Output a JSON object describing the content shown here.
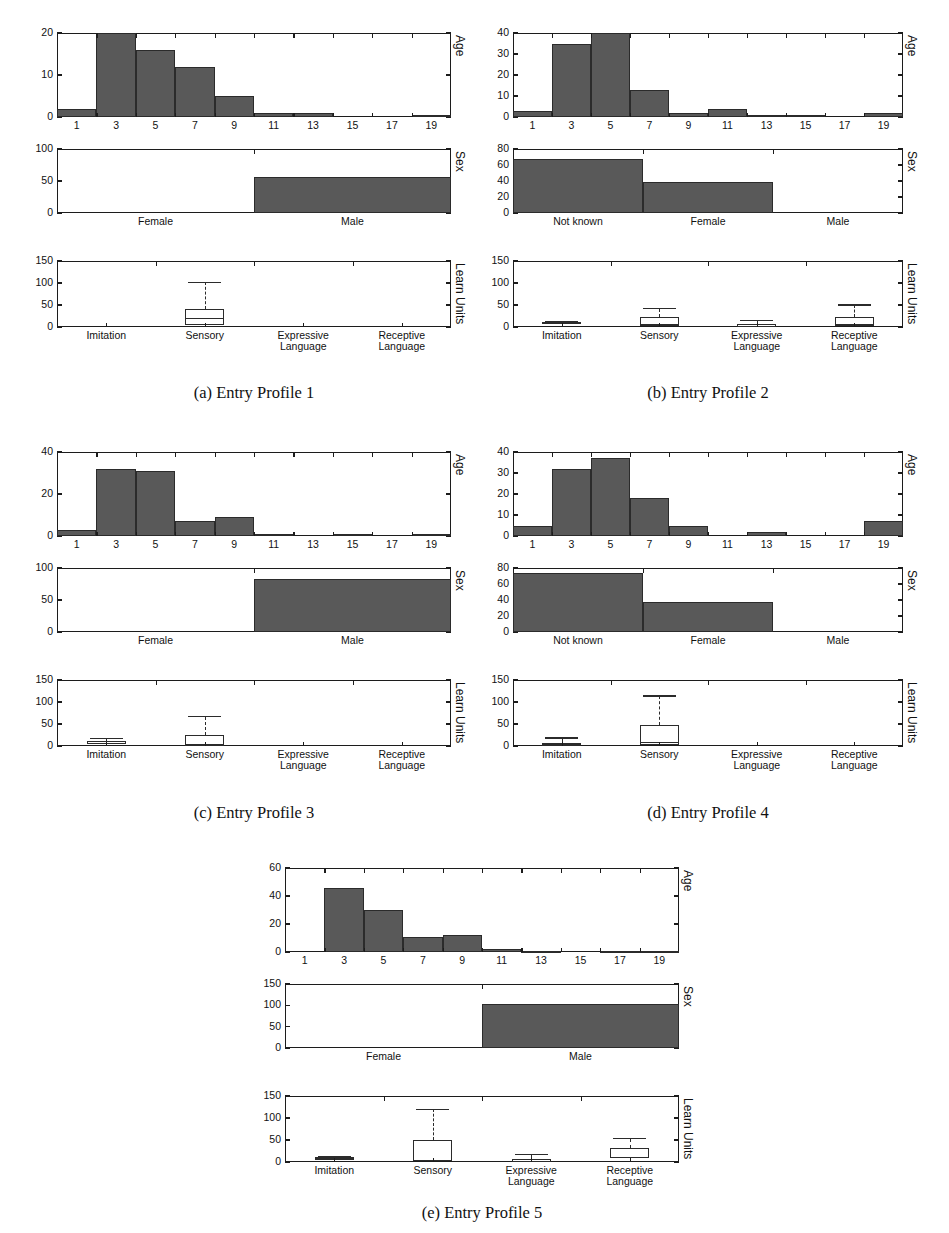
{
  "figure": {
    "panel_axis_titles": [
      "Age",
      "Sex",
      "Learn Units"
    ]
  },
  "chart_data": [
    {
      "type": "bar",
      "panel": "Age",
      "profile": "Entry Profile 1",
      "title": "",
      "xlabel": "",
      "ylabel": "Age",
      "categories": [
        "1",
        "3",
        "5",
        "7",
        "9",
        "11",
        "13",
        "15",
        "17",
        "19"
      ],
      "values": [
        2,
        20,
        16,
        12,
        5,
        1,
        1,
        0,
        0,
        0.5
      ],
      "ylim": [
        0,
        20
      ],
      "yticks": [
        0,
        10,
        20
      ],
      "grid": false
    },
    {
      "type": "bar",
      "panel": "Sex",
      "profile": "Entry Profile 1",
      "title": "",
      "xlabel": "",
      "ylabel": "Sex",
      "categories": [
        "Female",
        "Male"
      ],
      "values": [
        0,
        57
      ],
      "ylim": [
        0,
        100
      ],
      "yticks": [
        0,
        50,
        100
      ],
      "grid": false
    },
    {
      "type": "box",
      "panel": "Learn Units",
      "profile": "Entry Profile 1",
      "title": "",
      "xlabel": "",
      "ylabel": "Learn Units",
      "categories": [
        "Imitation",
        "Sensory",
        "Expressive\nLanguage",
        "Receptive\nLanguage"
      ],
      "boxes": [
        {
          "name": "Imitation",
          "q1": 0,
          "median": 0,
          "q3": 0,
          "whisker_low": 0,
          "whisker_high": 0
        },
        {
          "name": "Sensory",
          "q1": 5,
          "median": 20,
          "q3": 42,
          "whisker_low": 2,
          "whisker_high": 102
        },
        {
          "name": "Expressive Language",
          "q1": 0,
          "median": 0,
          "q3": 0,
          "whisker_low": 0,
          "whisker_high": 0
        },
        {
          "name": "Receptive Language",
          "q1": 0,
          "median": 0,
          "q3": 0,
          "whisker_low": 0,
          "whisker_high": 0
        }
      ],
      "ylim": [
        0,
        150
      ],
      "yticks": [
        0,
        50,
        100,
        150
      ],
      "grid": false
    },
    {
      "type": "bar",
      "panel": "Age",
      "profile": "Entry Profile 2",
      "categories": [
        "1",
        "3",
        "5",
        "7",
        "9",
        "11",
        "13",
        "15",
        "17",
        "19"
      ],
      "values": [
        3,
        35,
        40,
        13,
        2,
        4,
        1,
        1,
        0,
        2
      ],
      "ylim": [
        0,
        40
      ],
      "yticks": [
        0,
        10,
        20,
        30,
        40
      ],
      "ylabel": "Age",
      "grid": false
    },
    {
      "type": "bar",
      "panel": "Sex",
      "profile": "Entry Profile 2",
      "categories": [
        "Not known",
        "Female",
        "Male"
      ],
      "values": [
        67,
        39,
        0
      ],
      "ylim": [
        0,
        80
      ],
      "yticks": [
        0,
        20,
        40,
        60,
        80
      ],
      "ylabel": "Sex",
      "grid": false
    },
    {
      "type": "box",
      "panel": "Learn Units",
      "profile": "Entry Profile 2",
      "categories": [
        "Imitation",
        "Sensory",
        "Expressive\nLanguage",
        "Receptive\nLanguage"
      ],
      "boxes": [
        {
          "name": "Imitation",
          "q1": 6,
          "median": 9,
          "q3": 11,
          "whisker_low": 5,
          "whisker_high": 12
        },
        {
          "name": "Sensory",
          "q1": 3,
          "median": 5,
          "q3": 22,
          "whisker_low": 1,
          "whisker_high": 42
        },
        {
          "name": "Expressive Language",
          "q1": 0,
          "median": 1,
          "q3": 6,
          "whisker_low": 0,
          "whisker_high": 15
        },
        {
          "name": "Receptive Language",
          "q1": 3,
          "median": 5,
          "q3": 22,
          "whisker_low": 1,
          "whisker_high": 50
        }
      ],
      "ylim": [
        0,
        150
      ],
      "yticks": [
        0,
        50,
        100,
        150
      ],
      "ylabel": "Learn Units",
      "grid": false
    },
    {
      "type": "bar",
      "panel": "Age",
      "profile": "Entry Profile 3",
      "categories": [
        "1",
        "3",
        "5",
        "7",
        "9",
        "11",
        "13",
        "15",
        "17",
        "19"
      ],
      "values": [
        3,
        32,
        31,
        7,
        9,
        1,
        0,
        1,
        0,
        1
      ],
      "ylim": [
        0,
        40
      ],
      "yticks": [
        0,
        20,
        40
      ],
      "ylabel": "Age",
      "grid": false
    },
    {
      "type": "bar",
      "panel": "Sex",
      "profile": "Entry Profile 3",
      "categories": [
        "Female",
        "Male"
      ],
      "values": [
        0,
        83
      ],
      "ylim": [
        0,
        100
      ],
      "yticks": [
        0,
        50,
        100
      ],
      "ylabel": "Sex",
      "grid": false
    },
    {
      "type": "box",
      "panel": "Learn Units",
      "profile": "Entry Profile 3",
      "categories": [
        "Imitation",
        "Sensory",
        "Expressive\nLanguage",
        "Receptive\nLanguage"
      ],
      "boxes": [
        {
          "name": "Imitation",
          "q1": 5,
          "median": 10,
          "q3": 12,
          "whisker_low": 4,
          "whisker_high": 17
        },
        {
          "name": "Sensory",
          "q1": 0,
          "median": 4,
          "q3": 25,
          "whisker_low": 0,
          "whisker_high": 67
        },
        {
          "name": "Expressive Language",
          "q1": 0,
          "median": 0,
          "q3": 0,
          "whisker_low": 0,
          "whisker_high": 0
        },
        {
          "name": "Receptive Language",
          "q1": 0,
          "median": 0,
          "q3": 0,
          "whisker_low": 0,
          "whisker_high": 0
        }
      ],
      "ylim": [
        0,
        150
      ],
      "yticks": [
        0,
        50,
        100,
        150
      ],
      "ylabel": "Learn Units",
      "grid": false
    },
    {
      "type": "bar",
      "panel": "Age",
      "profile": "Entry Profile 4",
      "categories": [
        "1",
        "3",
        "5",
        "7",
        "9",
        "11",
        "13",
        "15",
        "17",
        "19"
      ],
      "values": [
        5,
        32,
        37,
        18,
        5,
        0,
        2,
        0,
        0,
        7
      ],
      "ylim": [
        0,
        40
      ],
      "yticks": [
        0,
        10,
        20,
        30,
        40
      ],
      "ylabel": "Age",
      "grid": false
    },
    {
      "type": "bar",
      "panel": "Sex",
      "profile": "Entry Profile 4",
      "categories": [
        "Not known",
        "Female",
        "Male"
      ],
      "values": [
        74,
        38,
        0
      ],
      "ylim": [
        0,
        80
      ],
      "yticks": [
        0,
        20,
        40,
        60,
        80
      ],
      "ylabel": "Sex",
      "grid": false
    },
    {
      "type": "box",
      "panel": "Learn Units",
      "profile": "Entry Profile 4",
      "categories": [
        "Imitation",
        "Sensory",
        "Expressive\nLanguage",
        "Receptive\nLanguage"
      ],
      "boxes": [
        {
          "name": "Imitation",
          "q1": 0,
          "median": 3,
          "q3": 6,
          "whisker_low": 0,
          "whisker_high": 18
        },
        {
          "name": "Sensory",
          "q1": 2,
          "median": 8,
          "q3": 48,
          "whisker_low": 1,
          "whisker_high": 114
        },
        {
          "name": "Expressive Language",
          "q1": 0,
          "median": 0,
          "q3": 0,
          "whisker_low": 0,
          "whisker_high": 0
        },
        {
          "name": "Receptive Language",
          "q1": 0,
          "median": 0,
          "q3": 0,
          "whisker_low": 0,
          "whisker_high": 0
        }
      ],
      "ylim": [
        0,
        150
      ],
      "yticks": [
        0,
        50,
        100,
        150
      ],
      "ylabel": "Learn Units",
      "grid": false
    },
    {
      "type": "bar",
      "panel": "Age",
      "profile": "Entry Profile 5",
      "categories": [
        "1",
        "3",
        "5",
        "7",
        "9",
        "11",
        "13",
        "15",
        "17",
        "19"
      ],
      "values": [
        0,
        46,
        30,
        11,
        12,
        2,
        1,
        0,
        1,
        1
      ],
      "ylim": [
        0,
        60
      ],
      "yticks": [
        0,
        20,
        40,
        60
      ],
      "ylabel": "Age",
      "grid": false
    },
    {
      "type": "bar",
      "panel": "Sex",
      "profile": "Entry Profile 5",
      "categories": [
        "Female",
        "Male"
      ],
      "values": [
        0,
        103
      ],
      "ylim": [
        0,
        150
      ],
      "yticks": [
        0,
        50,
        100,
        150
      ],
      "ylabel": "Sex",
      "grid": false
    },
    {
      "type": "box",
      "panel": "Learn Units",
      "profile": "Entry Profile 5",
      "categories": [
        "Imitation",
        "Sensory",
        "Expressive\nLanguage",
        "Receptive\nLanguage"
      ],
      "boxes": [
        {
          "name": "Imitation",
          "q1": 5,
          "median": 8,
          "q3": 11,
          "whisker_low": 4,
          "whisker_high": 12
        },
        {
          "name": "Sensory",
          "q1": 2,
          "median": 3,
          "q3": 50,
          "whisker_low": 1,
          "whisker_high": 120
        },
        {
          "name": "Expressive Language",
          "q1": 0,
          "median": 1,
          "q3": 7,
          "whisker_low": 0,
          "whisker_high": 17
        },
        {
          "name": "Receptive Language",
          "q1": 8,
          "median": 10,
          "q3": 31,
          "whisker_low": 5,
          "whisker_high": 53
        }
      ],
      "ylim": [
        0,
        150
      ],
      "yticks": [
        0,
        50,
        100,
        150
      ],
      "ylabel": "Learn Units",
      "grid": false
    }
  ],
  "profiles": [
    {
      "id": "a",
      "caption": "(a) Entry Profile 1"
    },
    {
      "id": "b",
      "caption": "(b) Entry Profile 2"
    },
    {
      "id": "c",
      "caption": "(c) Entry Profile 3"
    },
    {
      "id": "d",
      "caption": "(d) Entry Profile 4"
    },
    {
      "id": "e",
      "caption": "(e) Entry Profile 5"
    }
  ]
}
